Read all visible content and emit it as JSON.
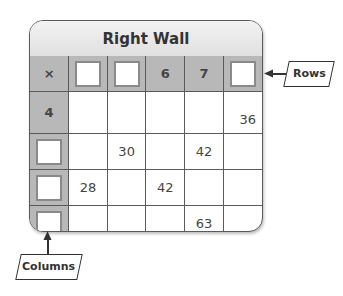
{
  "title": "Right Wall",
  "corner_symbol": "×",
  "header_row": [
    "",
    "",
    "6",
    "7",
    ""
  ],
  "row_headers": [
    "4",
    "",
    "",
    ""
  ],
  "cells": [
    [
      "",
      "",
      "",
      "",
      "36"
    ],
    [
      "",
      "30",
      "",
      "42",
      ""
    ],
    [
      "28",
      "",
      "42",
      "",
      ""
    ],
    [
      "",
      "",
      "",
      "63",
      ""
    ]
  ],
  "labels": {
    "rows": "Rows",
    "columns": "Columns"
  }
}
